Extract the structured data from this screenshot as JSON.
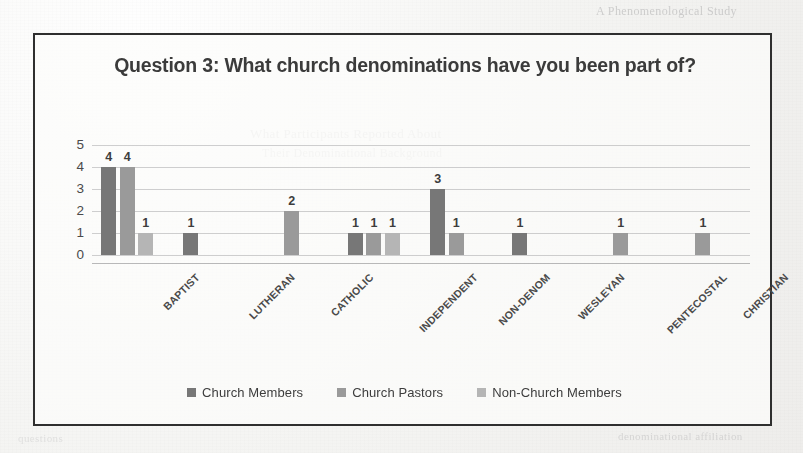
{
  "page": {
    "bleed_text_top_right": "A Phenomenological Study",
    "bleed_text_mid_1": "What Participants Reported About",
    "bleed_text_mid_2": "Their Denominational Background",
    "bleed_text_bottom_right": "denominational affiliation",
    "bleed_text_bottom_left": "questions"
  },
  "chart_data": {
    "type": "bar",
    "title": "Question 3: What church denominations have you been part of?",
    "xlabel": "",
    "ylabel": "",
    "ylim": [
      0,
      5
    ],
    "yticks": [
      0,
      1,
      2,
      3,
      4,
      5
    ],
    "grid": true,
    "legend_position": "bottom",
    "categories": [
      "BAPTIST",
      "LUTHERAN",
      "CATHOLIC",
      "INDEPENDENT",
      "NON-DENOM",
      "WESLEYAN",
      "PENTECOSTAL",
      "CHRISTIAN"
    ],
    "series": [
      {
        "name": "Church Members",
        "color": "#777777",
        "values": [
          4,
          1,
          0,
          1,
          3,
          1,
          0,
          0
        ]
      },
      {
        "name": "Church Pastors",
        "color": "#9a9a9a",
        "values": [
          4,
          0,
          2,
          1,
          1,
          0,
          1,
          1
        ]
      },
      {
        "name": "Non-Church Members",
        "color": "#b5b5b5",
        "values": [
          1,
          0,
          0,
          1,
          0,
          0,
          0,
          0
        ]
      }
    ],
    "data_labels": [
      "4",
      "4",
      "1",
      "1",
      "2",
      "1",
      "1",
      "1",
      "3",
      "1",
      "1",
      "1",
      "1"
    ]
  }
}
